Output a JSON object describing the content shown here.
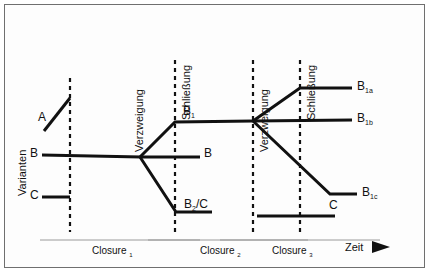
{
  "diagram": {
    "axes": {
      "y_label": "Varianten",
      "x_label": "Zeit",
      "x_arrow": "arrow-right-icon"
    },
    "event_labels": [
      {
        "id": "verzweigung-1",
        "text": "Verzweigung",
        "x": 128
      },
      {
        "id": "schliessung-1",
        "text": "Schließung",
        "x": 175
      },
      {
        "id": "verzweigung-2",
        "text": "Verzweigung",
        "x": 253
      },
      {
        "id": "schliessung-2",
        "text": "Schließung",
        "x": 300
      }
    ],
    "variant_labels": [
      {
        "id": "variant-a",
        "text": "A",
        "x": 40,
        "y": 118
      },
      {
        "id": "variant-b-start",
        "text": "B",
        "x": 32,
        "y": 152
      },
      {
        "id": "variant-c-start",
        "text": "C",
        "x": 32,
        "y": 194
      },
      {
        "id": "variant-b1",
        "text": "B",
        "sub": "1",
        "x": 184,
        "y": 110
      },
      {
        "id": "variant-b-mid",
        "text": "B",
        "x": 203,
        "y": 152
      },
      {
        "id": "variant-b2c",
        "text": "B",
        "sub": "2",
        "suffix": "/C",
        "x": 185,
        "y": 203
      },
      {
        "id": "variant-b1a",
        "text": "B",
        "sub": "1a",
        "x": 358,
        "y": 82
      },
      {
        "id": "variant-b1b",
        "text": "B",
        "sub": "1b",
        "x": 358,
        "y": 114
      },
      {
        "id": "variant-b1c",
        "text": "B",
        "sub": "1c",
        "x": 363,
        "y": 188
      },
      {
        "id": "variant-c-end",
        "text": "C",
        "x": 331,
        "y": 205
      }
    ],
    "closures": [
      {
        "id": "closure-1",
        "text": "Closure",
        "sub": "1",
        "center_x": 120,
        "line_from": 40,
        "line_to": 200
      },
      {
        "id": "closure-2",
        "text": "Closure",
        "sub": "2",
        "center_x": 228,
        "line_from": 148,
        "line_to": 308
      },
      {
        "id": "closure-3",
        "text": "Closure",
        "sub": "3",
        "center_x": 300,
        "line_from": 220,
        "line_to": 380
      }
    ],
    "colors": {
      "line": "#111111",
      "dashed": "#111111",
      "frame": "#6f6f6f",
      "background": "#ffffff",
      "closure_rule": "#9a9a9a"
    },
    "dashed_lines": [
      {
        "id": "dash-closure-1",
        "x": 70,
        "y1": 78,
        "y2": 232
      },
      {
        "id": "dash-closure-2",
        "x": 175,
        "y1": 60,
        "y2": 232
      },
      {
        "id": "dash-closure-3",
        "x": 253,
        "y1": 60,
        "y2": 232
      },
      {
        "id": "dash-closure-4",
        "x": 300,
        "y1": 60,
        "y2": 232
      }
    ],
    "paths": [
      {
        "id": "path-a",
        "d": "M 44 131 L 70 98",
        "desc": "Variante A steigt bis Closure 1"
      },
      {
        "id": "path-b",
        "d": "M 42 155 L 140 157",
        "desc": "Variante B laeuft bis erste Verzweigung"
      },
      {
        "id": "path-c",
        "d": "M 42 197 L 70 197",
        "desc": "Variante C endet an Closure 1"
      },
      {
        "id": "path-b-to-b1",
        "d": "M 140 157 L 175 122 L 253 121",
        "desc": "Verzweigung nach oben zu B1"
      },
      {
        "id": "path-b-to-b",
        "d": "M 140 157 L 200 157",
        "desc": "Verzweigung geradeaus B"
      },
      {
        "id": "path-b-to-b2c",
        "d": "M 140 157 L 176 212 L 212 212",
        "desc": "Verzweigung nach unten zu B2/C"
      },
      {
        "id": "path-b1-to-b1a",
        "d": "M 253 121 L 300 88 L 352 88",
        "desc": "Zweite Verzweigung nach oben zu B1a"
      },
      {
        "id": "path-b1-to-b1b",
        "d": "M 253 121 L 352 120",
        "desc": "Zweite Verzweigung geradeaus zu B1b"
      },
      {
        "id": "path-b1-to-b1c",
        "d": "M 253 121 L 330 194 L 357 194",
        "desc": "Zweite Verzweigung nach unten zu B1c"
      },
      {
        "id": "path-c-end",
        "d": "M 257 216 L 335 216",
        "desc": "Variante C im dritten Closure"
      }
    ],
    "axis_arrow": {
      "id": "zeit-arrow",
      "x": 382,
      "y": 248
    }
  }
}
